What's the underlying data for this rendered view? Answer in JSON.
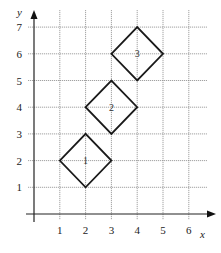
{
  "chart_data": {
    "type": "scatter",
    "title": "",
    "xlabel": "x",
    "ylabel": "y",
    "xlim": [
      0,
      6.7
    ],
    "ylim": [
      0,
      7.6
    ],
    "x_ticks": [
      "1",
      "2",
      "3",
      "4",
      "5",
      "6"
    ],
    "y_ticks": [
      "1",
      "2",
      "3",
      "4",
      "5",
      "6",
      "7"
    ],
    "grid": true,
    "legend": null,
    "shapes": [
      {
        "name": "1",
        "kind": "square (rotated 45°)",
        "center": [
          2,
          2
        ],
        "vertices": [
          [
            1,
            2
          ],
          [
            2,
            3
          ],
          [
            3,
            2
          ],
          [
            2,
            1
          ]
        ]
      },
      {
        "name": "2",
        "kind": "square (rotated 45°)",
        "center": [
          3,
          4
        ],
        "vertices": [
          [
            2,
            4
          ],
          [
            3,
            5
          ],
          [
            4,
            4
          ],
          [
            3,
            3
          ]
        ]
      },
      {
        "name": "3",
        "kind": "square (rotated 45°)",
        "center": [
          4,
          6
        ],
        "vertices": [
          [
            3,
            6
          ],
          [
            4,
            7
          ],
          [
            5,
            6
          ],
          [
            4,
            5
          ]
        ]
      }
    ]
  },
  "layout": {
    "origin_px": [
      34,
      214
    ],
    "x_unit_px": 25.8,
    "y_unit_px": 26.7,
    "grid_right_px": 207,
    "grid_top_px": 10
  }
}
